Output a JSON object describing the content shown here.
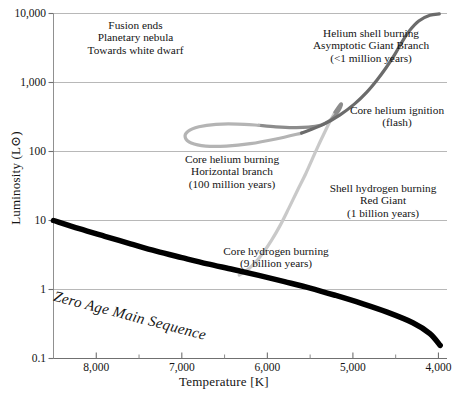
{
  "chart_data": {
    "type": "line",
    "title": "",
    "xlabel": "Temperature [K]",
    "ylabel": "Luminosity (L⊙)",
    "xlim": [
      8500,
      3900
    ],
    "ylim": [
      0.1,
      10000
    ],
    "x_scale": "linear-reversed",
    "y_scale": "log",
    "grid": true,
    "legend": "none",
    "xticks": [
      "8,000",
      "7,000",
      "6,000",
      "5,000",
      "4,000"
    ],
    "xtick_values": [
      8000,
      7000,
      6000,
      5000,
      4000
    ],
    "xminor_ticks": [
      7500,
      6500,
      5500,
      4500
    ],
    "yticks": [
      "10,000",
      "1,000",
      "100",
      "10",
      "1",
      "0.1"
    ],
    "ytick_values": [
      10000,
      1000,
      100,
      10,
      1,
      0.1
    ],
    "series": [
      {
        "name": "Zero Age Main Sequence",
        "color": "#000000",
        "width": 5.5,
        "points": [
          [
            8500,
            10.0
          ],
          [
            8200,
            7.6
          ],
          [
            7900,
            5.9
          ],
          [
            7600,
            4.6
          ],
          [
            7300,
            3.6
          ],
          [
            7000,
            2.9
          ],
          [
            6700,
            2.35
          ],
          [
            6400,
            1.95
          ],
          [
            6100,
            1.6
          ],
          [
            5800,
            1.3
          ],
          [
            5500,
            1.05
          ],
          [
            5200,
            0.82
          ],
          [
            4900,
            0.63
          ],
          [
            4600,
            0.47
          ],
          [
            4300,
            0.33
          ],
          [
            4100,
            0.23
          ],
          [
            3980,
            0.155
          ]
        ]
      },
      {
        "name": "Red Giant Branch (shell hydrogen burning)",
        "color": "#c9c9c9",
        "width": 3.2,
        "points": [
          [
            6330,
            1.62
          ],
          [
            6250,
            1.85
          ],
          [
            6150,
            2.4
          ],
          [
            6050,
            3.4
          ],
          [
            5950,
            5.2
          ],
          [
            5850,
            8.5
          ],
          [
            5750,
            15.0
          ],
          [
            5650,
            27.0
          ],
          [
            5550,
            48.0
          ],
          [
            5470,
            80.0
          ],
          [
            5400,
            125.0
          ],
          [
            5330,
            190.0
          ],
          [
            5270,
            270.0
          ],
          [
            5210,
            370.0
          ]
        ]
      },
      {
        "name": "Core helium ignition (flash) hook",
        "color": "#8c8c8c",
        "width": 3.2,
        "points": [
          [
            5210,
            370.0
          ],
          [
            5170,
            440.0
          ],
          [
            5140,
            490.0
          ],
          [
            5135,
            470.0
          ],
          [
            5160,
            400.0
          ],
          [
            5210,
            330.0
          ],
          [
            5280,
            275.0
          ],
          [
            5380,
            240.0
          ],
          [
            5520,
            225.0
          ],
          [
            5700,
            222.0
          ],
          [
            5900,
            228.0
          ],
          [
            6100,
            240.0
          ]
        ]
      },
      {
        "name": "Horizontal Branch (core helium burning)",
        "color": "#b4b4b4",
        "width": 3.2,
        "points": [
          [
            6100,
            240.0
          ],
          [
            6350,
            250.0
          ],
          [
            6600,
            248.0
          ],
          [
            6800,
            228.0
          ],
          [
            6930,
            195.0
          ],
          [
            6960,
            160.0
          ],
          [
            6890,
            133.0
          ],
          [
            6720,
            120.0
          ],
          [
            6480,
            120.0
          ],
          [
            6200,
            130.0
          ],
          [
            5900,
            152.0
          ],
          [
            5600,
            185.0
          ]
        ]
      },
      {
        "name": "Asymptotic Giant Branch (helium shell burning)",
        "color": "#6b6b6b",
        "width": 3.2,
        "points": [
          [
            5600,
            185.0
          ],
          [
            5350,
            245.0
          ],
          [
            5150,
            340.0
          ],
          [
            4980,
            490.0
          ],
          [
            4840,
            720.0
          ],
          [
            4720,
            1080.0
          ],
          [
            4610,
            1650.0
          ],
          [
            4510,
            2550.0
          ],
          [
            4430,
            3800.0
          ],
          [
            4340,
            5600.0
          ],
          [
            4230,
            7800.0
          ],
          [
            4100,
            9400.0
          ],
          [
            3990,
            9850.0
          ]
        ]
      }
    ],
    "annotations": [
      {
        "name": "fusion-ends",
        "lines": [
          "Fusion ends",
          "Planetary nebula",
          "Towards white dwarf"
        ],
        "align": "center"
      },
      {
        "name": "agb",
        "lines": [
          "Helium shell burning",
          "Asymptotic Giant Branch",
          "(<1 million years)"
        ],
        "align": "center"
      },
      {
        "name": "helium-flash",
        "lines": [
          "Core helium ignition",
          "(flash)"
        ],
        "align": "center"
      },
      {
        "name": "horizontal-branch",
        "lines": [
          "Core helium burning",
          "Horizontal branch",
          "(100 million years)"
        ],
        "align": "center"
      },
      {
        "name": "red-giant",
        "lines": [
          "Shell hydrogen burning",
          "Red Giant",
          "(1 billion years)"
        ],
        "align": "center"
      },
      {
        "name": "core-hydrogen-burning",
        "lines": [
          "Core hydrogen burning",
          "(9 billion years)"
        ],
        "align": "center"
      },
      {
        "name": "zams",
        "lines": [
          "Zero Age Main Sequence"
        ],
        "align": "left"
      }
    ]
  }
}
